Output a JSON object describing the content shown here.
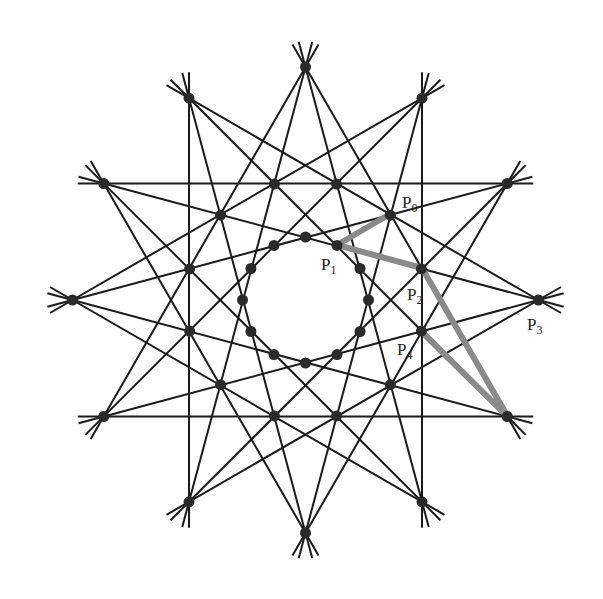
{
  "diagram": {
    "center": [
      305.5,
      300
    ],
    "outer_radius": 233,
    "middle_radius": 120,
    "inner_radius": 63,
    "hole_radius": 33,
    "tail_length": 26,
    "line_color": "#1a1a1a",
    "dot_color": "#2a2a2a",
    "highlight_color": "#8a8a8a",
    "star_steps": [
      4,
      5
    ],
    "labels": [
      {
        "id": "P0",
        "base": "P",
        "sub": "0",
        "x": 402,
        "y": 208
      },
      {
        "id": "P1",
        "base": "P",
        "sub": "1",
        "x": 321,
        "y": 270
      },
      {
        "id": "P2",
        "base": "P",
        "sub": "2",
        "x": 407,
        "y": 300
      },
      {
        "id": "P3",
        "base": "P",
        "sub": "3",
        "x": 527,
        "y": 330
      },
      {
        "id": "P4",
        "base": "P",
        "sub": "4",
        "x": 397,
        "y": 355
      }
    ],
    "highlight_path": [
      [
        390,
        214
      ],
      [
        337,
        245
      ],
      [
        422,
        268
      ],
      [
        508,
        417
      ],
      [
        422,
        332
      ]
    ]
  }
}
